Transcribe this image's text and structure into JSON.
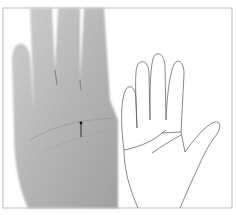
{
  "figure": {
    "left_panel": {
      "kind": "photo",
      "subject": "palm of hand with arrow marker"
    },
    "right_panel": {
      "kind": "line-drawing",
      "subject": "outline of hand with palm lines"
    },
    "colors": {
      "border": "#bdbdbd",
      "skin_light": "#c9c9c9",
      "skin_dark": "#8f8f8f",
      "line": "#555555"
    }
  }
}
